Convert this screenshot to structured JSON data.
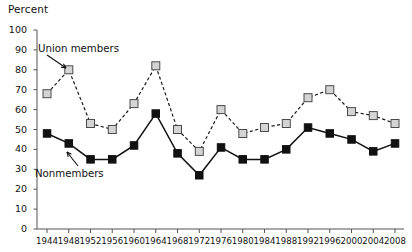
{
  "chart_data": {
    "type": "line",
    "title": "",
    "ylabel": "Percent",
    "xlabel": "",
    "ylim": [
      0,
      100
    ],
    "ytick_step": 10,
    "grid": false,
    "legend": "inline-annotations",
    "yticks": [
      "0",
      "10",
      "20",
      "30",
      "40",
      "50",
      "60",
      "70",
      "80",
      "90",
      "100"
    ],
    "categories": [
      "1944",
      "1948",
      "1952",
      "1956",
      "1960",
      "1964",
      "1968",
      "1972",
      "1976",
      "1980",
      "1984",
      "1988",
      "1992",
      "1996",
      "2000",
      "2004",
      "2008"
    ],
    "series": [
      {
        "name": "Union members",
        "marker": "open-square",
        "line": "dashed",
        "color": "#d4d4d4",
        "values": [
          68,
          80,
          53,
          50,
          63,
          82,
          50,
          39,
          60,
          48,
          51,
          53,
          66,
          70,
          59,
          57,
          53
        ]
      },
      {
        "name": "Nonmembers",
        "marker": "filled-square",
        "line": "solid",
        "color": "#111111",
        "values": [
          48,
          43,
          35,
          35,
          42,
          58,
          38,
          27,
          41,
          35,
          35,
          40,
          51,
          48,
          45,
          39,
          43
        ]
      }
    ],
    "annotations": [
      {
        "text": "Union members",
        "target_series": "Union members",
        "target_category": "1948"
      },
      {
        "text": "Nonmembers",
        "target_series": "Nonmembers",
        "target_category": "1952"
      }
    ]
  },
  "labels": {
    "y_axis_title": "Percent",
    "union_label": "Union members",
    "nonmember_label": "Nonmembers"
  }
}
